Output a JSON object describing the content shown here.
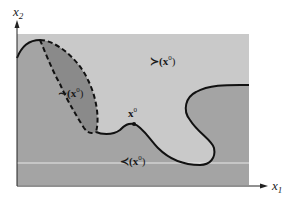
{
  "diagram": {
    "axes": {
      "x_label": "x",
      "x_subscript": "1",
      "y_label": "x",
      "y_subscript": "2"
    },
    "regions": {
      "preferred": {
        "label": "≻(x",
        "sup": "0",
        "close": ")",
        "color": "#c9c9c9"
      },
      "indifferent": {
        "label": "∼(x",
        "sup": "0",
        "close": ")",
        "color": "#8a8a8a"
      },
      "worse": {
        "label": "≺(x",
        "sup": "0",
        "close": ")",
        "color": "#a4a4a4"
      }
    },
    "point": {
      "label": "x",
      "sup": "0"
    },
    "colors": {
      "background": "#ffffff",
      "curve": "#111111",
      "axis": "#222222",
      "divider_line": "#e8e8e8"
    }
  }
}
